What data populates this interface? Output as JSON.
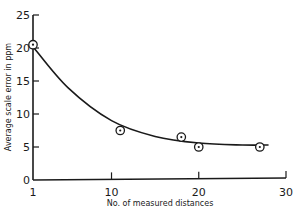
{
  "chart_data": {
    "type": "scatter",
    "title": "",
    "xlabel": "No. of measured distances",
    "ylabel": "Average scale error in ppm",
    "xlim": [
      1,
      30
    ],
    "ylim": [
      0,
      25
    ],
    "xticks": [
      1,
      10,
      20,
      30
    ],
    "yticks": [
      0,
      5,
      10,
      15,
      20,
      25
    ],
    "grid": false,
    "legend": null,
    "series": [
      {
        "name": "Measured points",
        "marker": "circled-dot",
        "x": [
          1,
          11,
          18,
          20,
          27
        ],
        "y": [
          20.5,
          7.5,
          6.5,
          5,
          5
        ]
      },
      {
        "name": "Fitted curve",
        "type": "line",
        "x": [
          1,
          5,
          10,
          15,
          20,
          25,
          28
        ],
        "y": [
          20.2,
          14,
          9,
          6.6,
          5.6,
          5.3,
          5.3
        ]
      }
    ]
  },
  "labels": {
    "xlabel": "No. of measured distances",
    "ylabel": "Average scale error in ppm",
    "xticks": [
      "1",
      "10",
      "20",
      "30"
    ],
    "yticks": [
      "0",
      "5",
      "10",
      "15",
      "20",
      "25"
    ]
  }
}
